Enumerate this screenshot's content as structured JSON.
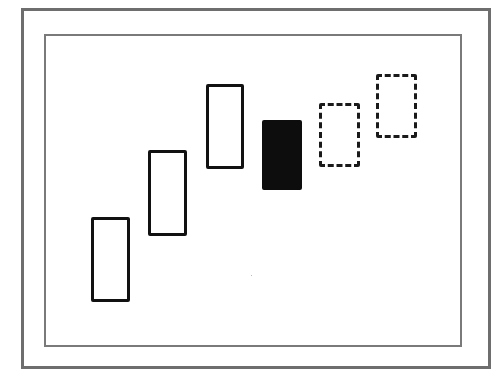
{
  "diagram": {
    "type": "candlestick-pattern",
    "frames": [
      "outer-frame",
      "inner-frame"
    ],
    "candles": [
      {
        "style": "hollow",
        "x": 91,
        "y": 217,
        "w": 39,
        "h": 85
      },
      {
        "style": "hollow",
        "x": 148,
        "y": 150,
        "w": 39,
        "h": 86
      },
      {
        "style": "hollow",
        "x": 206,
        "y": 84,
        "w": 38,
        "h": 85
      },
      {
        "style": "filled",
        "x": 262,
        "y": 120,
        "w": 40,
        "h": 70
      },
      {
        "style": "dashed",
        "x": 319,
        "y": 103,
        "w": 41,
        "h": 64
      },
      {
        "style": "dashed",
        "x": 376,
        "y": 74,
        "w": 41,
        "h": 64
      }
    ],
    "colors": {
      "stroke": "#111111",
      "filled": "#0d0d0d",
      "frame": "#6e6e6e"
    }
  }
}
